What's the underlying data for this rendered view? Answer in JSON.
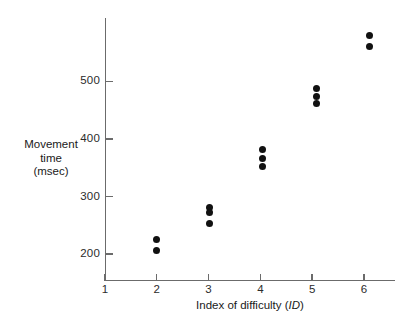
{
  "chart_data": {
    "type": "scatter",
    "title": "",
    "xlabel": "Index of difficulty (ID)",
    "xlabel_plain": "Index of difficulty (",
    "xlabel_italic": "ID",
    "xlabel_tail": ")",
    "ylabel_lines": [
      "Movement",
      "time",
      "(msec)"
    ],
    "ylabel": "Movement time (msec)",
    "xlim": [
      1,
      6.6
    ],
    "ylim": [
      155,
      610
    ],
    "xticks": [
      1,
      2,
      3,
      4,
      5,
      6
    ],
    "xtick_labels": [
      "1",
      "2",
      "3",
      "4",
      "5",
      "6"
    ],
    "yticks": [
      200,
      300,
      400,
      500
    ],
    "ytick_labels": [
      "200",
      "300",
      "400",
      "500"
    ],
    "grid": false,
    "legend": false,
    "marker": "filled-circle",
    "marker_color": "#111111",
    "axis_color": "#6b6b6b",
    "points": [
      {
        "x": 2.0,
        "y": 225
      },
      {
        "x": 2.0,
        "y": 207
      },
      {
        "x": 3.02,
        "y": 281
      },
      {
        "x": 3.02,
        "y": 272
      },
      {
        "x": 3.02,
        "y": 253
      },
      {
        "x": 4.05,
        "y": 381
      },
      {
        "x": 4.05,
        "y": 366
      },
      {
        "x": 4.05,
        "y": 352
      },
      {
        "x": 5.08,
        "y": 487
      },
      {
        "x": 5.08,
        "y": 473
      },
      {
        "x": 5.08,
        "y": 461
      },
      {
        "x": 6.1,
        "y": 580
      },
      {
        "x": 6.1,
        "y": 561
      }
    ]
  }
}
